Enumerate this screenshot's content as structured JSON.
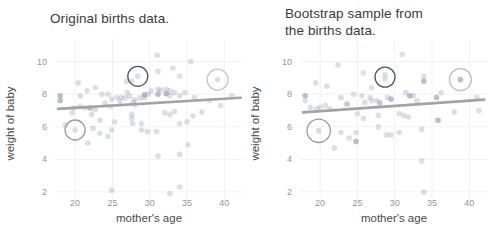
{
  "page": {
    "background": "#ffffff"
  },
  "chart_data": [
    {
      "type": "scatter",
      "title": "Original births data.",
      "xlabel": "mother's age",
      "ylabel": "weight of baby",
      "xlim": [
        17.3,
        42.5
      ],
      "ylim": [
        1.5,
        10.9
      ],
      "xticks": [
        20,
        25,
        30,
        35,
        40
      ],
      "yticks": [
        2,
        4,
        6,
        8,
        10
      ],
      "grid": "faint",
      "legend": "none",
      "point_color": "#8e96ad",
      "trend_color": "#a3a3a3",
      "trend_line": {
        "x1": 17.7,
        "y1": 7.1,
        "x2": 42.2,
        "y2": 7.78
      },
      "points": [
        [
          18,
          7.9,
          1
        ],
        [
          18,
          7.6,
          1
        ],
        [
          19.8,
          7.15,
          0
        ],
        [
          20.7,
          7.25,
          0
        ],
        [
          20.7,
          7.9,
          0
        ],
        [
          21.3,
          7.15,
          0
        ],
        [
          22,
          7.15,
          1
        ],
        [
          22.7,
          7.05,
          0
        ],
        [
          23.6,
          8.0,
          0
        ],
        [
          24,
          7.46,
          0
        ],
        [
          24.7,
          7.25,
          0
        ],
        [
          25.6,
          7.8,
          0
        ],
        [
          26,
          7.56,
          0
        ],
        [
          26.7,
          7.77,
          0
        ],
        [
          27,
          8.1,
          0
        ],
        [
          27.3,
          7.87,
          0
        ],
        [
          27.8,
          7.5,
          0
        ],
        [
          28,
          7.66,
          0
        ],
        [
          28,
          7.35,
          0
        ],
        [
          28.7,
          7.77,
          0
        ],
        [
          29.3,
          7.97,
          1
        ],
        [
          29.3,
          7.77,
          0
        ],
        [
          29.8,
          8.0,
          0
        ],
        [
          30.2,
          8.2,
          0
        ],
        [
          31.1,
          8.3,
          0
        ],
        [
          31.1,
          8.0,
          1
        ],
        [
          31.5,
          8.24,
          0
        ],
        [
          32.2,
          8.3,
          0
        ],
        [
          32.2,
          8.03,
          1
        ],
        [
          32.7,
          8.2,
          0
        ],
        [
          32.7,
          7.9,
          0
        ],
        [
          33.3,
          8.1,
          0
        ],
        [
          34,
          7.9,
          0
        ],
        [
          34.7,
          8.1,
          0
        ],
        [
          36,
          7.8,
          0
        ],
        [
          38,
          7.6,
          0
        ],
        [
          39.5,
          7.3,
          0
        ],
        [
          41,
          7.9,
          0
        ],
        [
          20.4,
          8.7,
          0
        ],
        [
          21.6,
          8.2,
          0
        ],
        [
          22.7,
          8.4,
          0
        ],
        [
          24.4,
          8.0,
          0
        ],
        [
          24.9,
          7.7,
          0
        ],
        [
          26.2,
          7.8,
          0
        ],
        [
          26.9,
          8.8,
          0
        ],
        [
          27.6,
          8.8,
          0
        ],
        [
          28.4,
          9.1,
          0
        ],
        [
          31.1,
          9.4,
          0
        ],
        [
          33.1,
          9.6,
          0
        ],
        [
          34,
          9.1,
          0
        ],
        [
          39.1,
          8.9,
          0
        ],
        [
          31,
          10.4,
          0
        ],
        [
          35.5,
          10.0,
          0
        ],
        [
          19.6,
          6.86,
          0
        ],
        [
          22.2,
          6.76,
          0
        ],
        [
          23.3,
          6.4,
          0
        ],
        [
          25.3,
          6.3,
          0
        ],
        [
          27.6,
          6.5,
          0
        ],
        [
          28.9,
          6.2,
          0
        ],
        [
          27.6,
          6.76,
          0
        ],
        [
          32,
          6.86,
          0
        ],
        [
          32.7,
          6.76,
          0
        ],
        [
          33.3,
          6.94,
          0
        ],
        [
          35.8,
          6.66,
          0
        ],
        [
          37,
          6.9,
          0
        ],
        [
          18.7,
          6.1,
          0
        ],
        [
          20,
          5.8,
          0
        ],
        [
          22.4,
          5.9,
          0
        ],
        [
          23.3,
          5.6,
          0
        ],
        [
          24.4,
          5.4,
          0
        ],
        [
          24.9,
          5.8,
          0
        ],
        [
          27.7,
          6.2,
          0
        ],
        [
          28.9,
          5.8,
          0
        ],
        [
          29.7,
          5.7,
          0
        ],
        [
          21.7,
          5.0,
          0
        ],
        [
          30.9,
          5.7,
          0
        ],
        [
          34,
          6.2,
          0
        ],
        [
          35,
          6.3,
          0
        ],
        [
          35.1,
          4.9,
          0
        ],
        [
          31.1,
          4.2,
          0
        ],
        [
          34,
          4.3,
          0
        ],
        [
          24.9,
          2.1,
          0
        ],
        [
          34,
          2.3,
          0
        ],
        [
          32.7,
          1.9,
          0
        ]
      ],
      "highlight_circles": [
        {
          "x": 28.4,
          "y": 9.1,
          "r": 10,
          "color": "#4d5260"
        },
        {
          "x": 39.1,
          "y": 8.9,
          "r": 10.5,
          "color": "#c6c6c6"
        },
        {
          "x": 20,
          "y": 5.8,
          "r": 10,
          "color": "#9b9b9b"
        }
      ]
    },
    {
      "type": "scatter",
      "title": "Bootstrap sample from\nthe births data.",
      "xlabel": "mother's age",
      "ylabel": "weight of baby",
      "xlim": [
        17.3,
        42.5
      ],
      "ylim": [
        1.5,
        10.9
      ],
      "xticks": [
        20,
        25,
        30,
        35,
        40
      ],
      "yticks": [
        2,
        4,
        6,
        8,
        10
      ],
      "grid": "faint",
      "legend": "none",
      "point_color": "#8e96ad",
      "trend_color": "#a3a3a3",
      "trend_line": {
        "x1": 17.7,
        "y1": 6.88,
        "x2": 42.0,
        "y2": 7.67
      },
      "points": [
        [
          18,
          7.9,
          1
        ],
        [
          18,
          7.6,
          0
        ],
        [
          18.7,
          7.2,
          0
        ],
        [
          20,
          7.2,
          0
        ],
        [
          19.4,
          8.7,
          0
        ],
        [
          20.9,
          8.5,
          0
        ],
        [
          22.4,
          9.8,
          0
        ],
        [
          25.8,
          9.3,
          0
        ],
        [
          28.7,
          9.2,
          0
        ],
        [
          28.7,
          8.95,
          0
        ],
        [
          33.9,
          9.1,
          0
        ],
        [
          33.9,
          8.8,
          1
        ],
        [
          38.8,
          8.9,
          1
        ],
        [
          31,
          10.45,
          0
        ],
        [
          26.9,
          8.4,
          0
        ],
        [
          22.8,
          7.8,
          0
        ],
        [
          23.7,
          7.4,
          0
        ],
        [
          24.5,
          8.0,
          0
        ],
        [
          25.6,
          7.9,
          0
        ],
        [
          26.7,
          7.8,
          0
        ],
        [
          26.9,
          7.6,
          0
        ],
        [
          27.6,
          7.6,
          0
        ],
        [
          28,
          7.5,
          0
        ],
        [
          29,
          7.8,
          0
        ],
        [
          29.5,
          7.7,
          1
        ],
        [
          31.5,
          8.1,
          0
        ],
        [
          32,
          7.9,
          1
        ],
        [
          32.5,
          7.9,
          0
        ],
        [
          33,
          7.6,
          0
        ],
        [
          35.6,
          7.8,
          1
        ],
        [
          36.2,
          8.1,
          0
        ],
        [
          41,
          7.8,
          0
        ],
        [
          19.5,
          7.1,
          0
        ],
        [
          20.7,
          7.3,
          0
        ],
        [
          21.3,
          7.1,
          0
        ],
        [
          23.5,
          7.4,
          0
        ],
        [
          25,
          6.8,
          0
        ],
        [
          25.8,
          6.5,
          0
        ],
        [
          26,
          7.5,
          0
        ],
        [
          27.8,
          6.7,
          0
        ],
        [
          28,
          7.4,
          0
        ],
        [
          30.6,
          6.8,
          0
        ],
        [
          31.2,
          6.7,
          0
        ],
        [
          31.8,
          6.6,
          0
        ],
        [
          38,
          6.9,
          0
        ],
        [
          41.3,
          7.0,
          0
        ],
        [
          19.8,
          5.75,
          0
        ],
        [
          21.9,
          4.7,
          0
        ],
        [
          22.8,
          5.65,
          0
        ],
        [
          23.9,
          5.3,
          0
        ],
        [
          24.8,
          5.1,
          1
        ],
        [
          24.8,
          5.65,
          0
        ],
        [
          27.8,
          6.0,
          0
        ],
        [
          28.9,
          5.5,
          0
        ],
        [
          29.5,
          5.5,
          0
        ],
        [
          30.6,
          5.65,
          0
        ],
        [
          33.6,
          5.85,
          0
        ],
        [
          35.8,
          6.4,
          1
        ],
        [
          33.6,
          3.9,
          0
        ],
        [
          33.9,
          2.0,
          0
        ]
      ],
      "highlight_circles": [
        {
          "x": 28.7,
          "y": 9.05,
          "r": 10,
          "color": "#4d5260"
        },
        {
          "x": 38.8,
          "y": 8.9,
          "r": 11,
          "color": "#bdbdbd"
        },
        {
          "x": 19.8,
          "y": 5.75,
          "r": 11.7,
          "color": "#9b9b9b"
        }
      ]
    }
  ],
  "style": {
    "grid_color": "#f2f2f2",
    "tick_label_color": "#969696",
    "axis_label_color": "#4a4a4a",
    "title_color": "#3a3a3a"
  }
}
